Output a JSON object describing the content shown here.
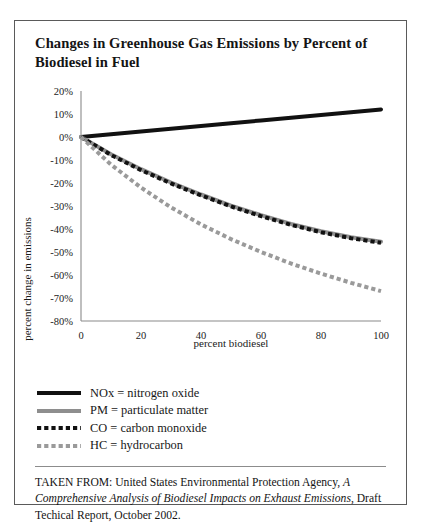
{
  "figure": {
    "title": "Changes in Greenhouse Gas Emissions by Percent of Biodiesel in Fuel",
    "source_prefix": "TAKEN FROM: United States Environmental Protection Agency, ",
    "source_italic": "A Comprehensive Analysis of Biodiesel Impacts on Exhaust Emissions",
    "source_suffix": ", Draft Techical Report, October 2002."
  },
  "legend": {
    "entries": [
      {
        "label": "NOx = nitrogen oxide",
        "key": "NOx",
        "style": "solid",
        "color": "#111111",
        "width": 4
      },
      {
        "label": "PM = particulate matter",
        "key": "PM",
        "style": "solid",
        "color": "#8e8e8e",
        "width": 4
      },
      {
        "label": "CO = carbon monoxide",
        "key": "CO",
        "style": "dashed",
        "color": "#111111",
        "width": 4
      },
      {
        "label": "HC = hydrocarbon",
        "key": "HC",
        "style": "dashed",
        "color": "#9a9a9a",
        "width": 4
      }
    ]
  },
  "chart_data": {
    "type": "line",
    "title": "Changes in Greenhouse Gas Emissions by Percent of Biodiesel in Fuel",
    "xlabel": "percent biodiesel",
    "ylabel": "percent change in emissions",
    "xlim": [
      0,
      100
    ],
    "ylim": [
      -80,
      20
    ],
    "xticks": [
      0,
      20,
      40,
      60,
      80,
      100
    ],
    "yticks": [
      20,
      10,
      0,
      -10,
      -20,
      -30,
      -40,
      -50,
      -60,
      -70,
      -80
    ],
    "ytick_labels": [
      "20%",
      "10%",
      "0%",
      "-10%",
      "-20%",
      "-30%",
      "-40%",
      "-50%",
      "-60%",
      "-70%",
      "-80%"
    ],
    "xtick_labels": [
      "0",
      "20",
      "40",
      "60",
      "80",
      "100"
    ],
    "grid": false,
    "legend_position": "below",
    "x": [
      0,
      10,
      20,
      30,
      40,
      50,
      60,
      70,
      80,
      90,
      100
    ],
    "series": [
      {
        "name": "NOx = nitrogen oxide",
        "short": "NOx",
        "color": "#111111",
        "style": "solid",
        "width": 4,
        "values": [
          0,
          1.2,
          2.4,
          3.6,
          4.8,
          6.0,
          7.2,
          8.4,
          9.6,
          10.8,
          12.0
        ]
      },
      {
        "name": "PM = particulate matter",
        "short": "PM",
        "color": "#8e8e8e",
        "style": "solid",
        "width": 4,
        "values": [
          0,
          -7.5,
          -14.0,
          -19.8,
          -25.0,
          -29.8,
          -34.0,
          -37.8,
          -41.0,
          -43.6,
          -45.5
        ]
      },
      {
        "name": "CO = carbon monoxide",
        "short": "CO",
        "color": "#111111",
        "style": "dashed",
        "width": 4,
        "values": [
          0,
          -7.8,
          -14.4,
          -20.2,
          -25.4,
          -30.2,
          -34.4,
          -38.2,
          -41.4,
          -44.0,
          -46.0
        ]
      },
      {
        "name": "HC = hydrocarbon",
        "short": "HC",
        "color": "#9a9a9a",
        "style": "dashed",
        "width": 4,
        "values": [
          0,
          -12.0,
          -22.0,
          -30.6,
          -38.0,
          -44.4,
          -50.0,
          -55.0,
          -59.4,
          -63.4,
          -67.0
        ]
      }
    ]
  }
}
